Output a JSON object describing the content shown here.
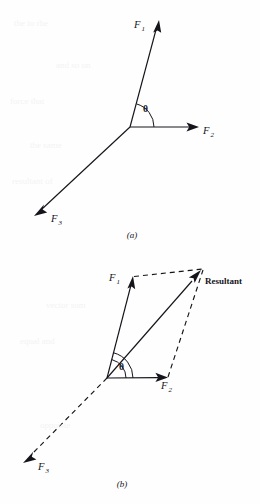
{
  "figure": {
    "background_color": "#fefefe",
    "ink_color": "#15141a",
    "panels": [
      {
        "id": "a",
        "caption": "(a)",
        "caption_x": 132,
        "caption_y": 237,
        "description": "Three concurrent force vectors F1, F2, F3 radiating from a common point, with angle theta between F1 and F2",
        "origin": {
          "x": 130,
          "y": 127
        },
        "vectors": [
          {
            "name": "F1",
            "label": "F",
            "subscript": "1",
            "label_x": 139,
            "label_y": 26,
            "tip": {
              "x": 159,
              "y": 21
            },
            "style": "solid",
            "arrow": true
          },
          {
            "name": "F2",
            "label": "F",
            "subscript": "2",
            "label_x": 205,
            "label_y": 134,
            "tip": {
              "x": 198,
              "y": 127
            },
            "style": "solid",
            "arrow": true
          },
          {
            "name": "F3",
            "label": "F",
            "subscript": "3",
            "label_x": 54,
            "label_y": 222,
            "tip": {
              "x": 35,
              "y": 214
            },
            "style": "solid",
            "arrow": true
          }
        ],
        "angle": {
          "name": "theta",
          "symbol": "θ",
          "label_x": 143,
          "label_y": 112,
          "between": [
            "F1",
            "F2"
          ],
          "arc_radius": 24
        }
      },
      {
        "id": "b",
        "caption": "(b)",
        "caption_x": 122,
        "caption_y": 486,
        "description": "Parallelogram law: F1 and F2 added with dashed construction lines give the Resultant; F3 shown dashed opposite the resultant",
        "origin": {
          "x": 107,
          "y": 378
        },
        "vectors": [
          {
            "name": "F1",
            "label": "F",
            "subscript": "1",
            "label_x": 113,
            "label_y": 281,
            "tip": {
              "x": 133,
              "y": 277
            },
            "style": "solid",
            "arrow": true
          },
          {
            "name": "F2",
            "label": "F",
            "subscript": "2",
            "label_x": 165,
            "label_y": 388,
            "tip": {
              "x": 167,
              "y": 377
            },
            "style": "solid",
            "arrow": true
          },
          {
            "name": "Resultant",
            "label": "Resultant",
            "subscript": "",
            "label_x": 205,
            "label_y": 284,
            "tip": {
              "x": 201,
              "y": 271
            },
            "style": "solid",
            "arrow": true
          },
          {
            "name": "F3",
            "label": "F",
            "subscript": "3",
            "label_x": 41,
            "label_y": 470,
            "tip": {
              "x": 24,
              "y": 462
            },
            "style": "dashed",
            "arrow": true
          }
        ],
        "construction_lines": [
          {
            "name": "f1-to-resultant",
            "from": {
              "x": 133,
              "y": 277
            },
            "to": {
              "x": 203,
              "y": 269
            },
            "style": "dashed"
          },
          {
            "name": "f2-to-resultant",
            "from": {
              "x": 167,
              "y": 377
            },
            "to": {
              "x": 203,
              "y": 269
            },
            "style": "dashed"
          }
        ],
        "angle": {
          "name": "theta",
          "symbol": "θ",
          "label_x": 120,
          "label_y": 370,
          "between": [
            "F1",
            "F2"
          ],
          "arc_radius": 26,
          "second_arc_radius": 19
        }
      }
    ]
  },
  "ghost_text": {
    "note": "faint scanned show-through text from reverse page",
    "lines": [
      {
        "text": "the to rhe",
        "x": 14,
        "y": 18
      },
      {
        "text": "and so on",
        "x": 56,
        "y": 60
      },
      {
        "text": "force that",
        "x": 10,
        "y": 96
      },
      {
        "text": "the same",
        "x": 30,
        "y": 140
      },
      {
        "text": "resultant of",
        "x": 12,
        "y": 176
      },
      {
        "text": "vector sum",
        "x": 46,
        "y": 300
      },
      {
        "text": "equal and",
        "x": 20,
        "y": 336
      },
      {
        "text": "opposite",
        "x": 40,
        "y": 420
      }
    ]
  }
}
